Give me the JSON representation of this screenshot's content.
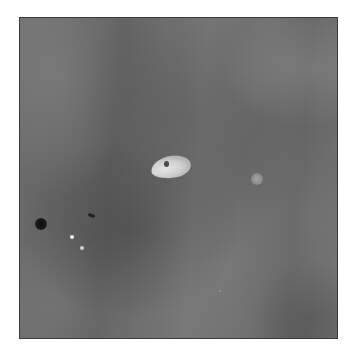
{
  "image": {
    "description": "Grayscale radiographic-style image with a bright central lesion, a small faint blob to the right, a dark circular spot and two bright specks at lower-left",
    "frame": {
      "x": 19,
      "y": 17,
      "width": 319,
      "height": 322,
      "border_color": "#3a3a3a"
    },
    "background_color": "#6e6e6e",
    "features": [
      {
        "name": "central-bright-lesion",
        "x": 151,
        "y": 149,
        "color": "#d8d8d8"
      },
      {
        "name": "lesion-dark-core",
        "x": 146,
        "y": 146,
        "color": "#4a4a4a"
      },
      {
        "name": "small-faint-blob",
        "x": 237,
        "y": 161,
        "color": "#a0a0a0"
      },
      {
        "name": "dark-round-spot",
        "x": 21,
        "y": 206,
        "color": "#141414"
      },
      {
        "name": "dark-dash-mark",
        "x": 71,
        "y": 197,
        "color": "#222222"
      },
      {
        "name": "bright-speck",
        "x": 52,
        "y": 219,
        "color": "#f2f2f2"
      },
      {
        "name": "bright-speck",
        "x": 62,
        "y": 230,
        "color": "#cfcfcf"
      }
    ]
  }
}
